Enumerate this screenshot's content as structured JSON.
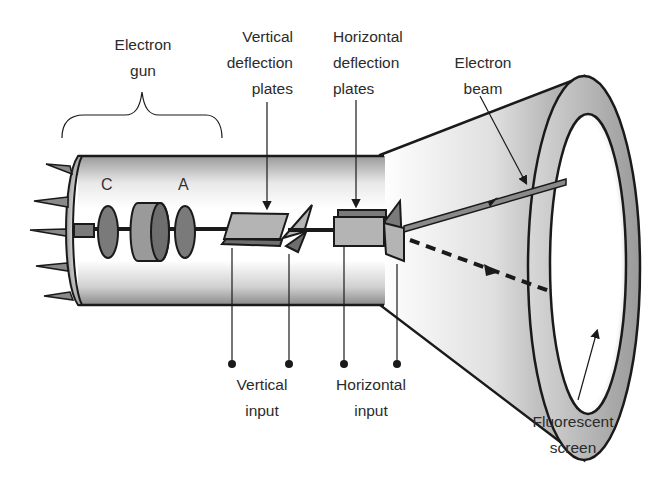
{
  "diagram": {
    "labels": {
      "electron_gun": [
        "Electron",
        "gun"
      ],
      "vertical_plates": [
        "Vertical",
        "deflection",
        "plates"
      ],
      "horizontal_plates": [
        "Horizontal",
        "deflection",
        "plates"
      ],
      "electron_beam": [
        "Electron",
        "beam"
      ],
      "vertical_input": [
        "Vertical",
        "input"
      ],
      "horizontal_input": [
        "Horizontal",
        "input"
      ],
      "fluorescent_screen": [
        "Fluorescent",
        "screen"
      ],
      "cathode": "C",
      "anode": "A"
    },
    "colors": {
      "outline": "#1a1a1a",
      "tube_dark": "#8c8c8c",
      "tube_light": "#ffffff",
      "component_fill": "#7a7a7a",
      "plate_fill": "#b4b4b4",
      "text": "#2b2b2b"
    }
  }
}
